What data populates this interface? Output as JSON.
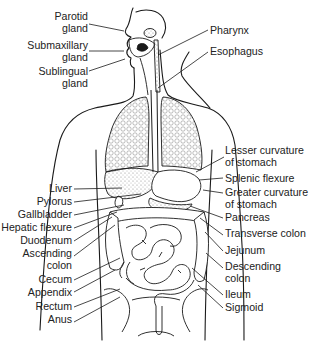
{
  "diagram": {
    "colors": {
      "ink": "#1a1a1a",
      "background": "#ffffff",
      "stipple": "#bdbdbd"
    },
    "left_labels": [
      {
        "id": "parotid-gland",
        "text": "Parotid\ngland",
        "x": 88,
        "y": 11,
        "line": [
          89,
          24,
          124,
          31
        ]
      },
      {
        "id": "submaxillary-gland",
        "text": "Submaxillary\ngland",
        "x": 88,
        "y": 40,
        "line": [
          89,
          51,
          124,
          51
        ]
      },
      {
        "id": "sublingual-gland",
        "text": "Sublingual\ngland",
        "x": 88,
        "y": 66,
        "line": [
          89,
          71,
          125,
          59
        ]
      },
      {
        "id": "liver",
        "text": "Liver",
        "x": 72,
        "y": 183,
        "line": [
          74,
          189,
          122,
          188
        ]
      },
      {
        "id": "pylorus",
        "text": "Pylorus",
        "x": 72,
        "y": 196,
        "line": [
          74,
          202,
          141,
          194
        ]
      },
      {
        "id": "gallbladder",
        "text": "Gallbladder",
        "x": 72,
        "y": 209,
        "line": [
          74,
          215,
          124,
          205
        ]
      },
      {
        "id": "hepatic-flexure",
        "text": "Hepatic flexure",
        "x": 72,
        "y": 222,
        "line": [
          74,
          228,
          117,
          212
        ]
      },
      {
        "id": "duodenum",
        "text": "Duodenum",
        "x": 72,
        "y": 235,
        "line": [
          74,
          241,
          112,
          217
        ]
      },
      {
        "id": "ascending-colon",
        "text": "Ascending\ncolon",
        "x": 72,
        "y": 248,
        "line": [
          74,
          256,
          115,
          225
        ]
      },
      {
        "id": "cecum",
        "text": "Cecum",
        "x": 72,
        "y": 274,
        "line": [
          74,
          280,
          120,
          258
        ]
      },
      {
        "id": "appendix",
        "text": "Appendix",
        "x": 72,
        "y": 287,
        "line": [
          74,
          292,
          115,
          270
        ]
      },
      {
        "id": "rectum",
        "text": "Rectum",
        "x": 72,
        "y": 301,
        "line": [
          74,
          307,
          120,
          289
        ]
      },
      {
        "id": "anus",
        "text": "Anus",
        "x": 72,
        "y": 314,
        "line": [
          74,
          322,
          120,
          297
        ]
      }
    ],
    "right_labels": [
      {
        "id": "pharynx",
        "text": "Pharynx",
        "x": 210,
        "y": 25,
        "line": [
          208,
          30,
          158,
          55
        ]
      },
      {
        "id": "esophagus",
        "text": "Esophagus",
        "x": 210,
        "y": 46,
        "line": [
          208,
          52,
          158,
          88
        ]
      },
      {
        "id": "lesser-curvature-of-stomach",
        "text": "Lesser curvature\nof stomach",
        "x": 225,
        "y": 145,
        "line": [
          224,
          157,
          196,
          172
        ]
      },
      {
        "id": "splenic-flexure",
        "text": "Splenic flexure",
        "x": 225,
        "y": 173,
        "line": [
          223,
          178,
          199,
          180
        ]
      },
      {
        "id": "greater-curvature-of-stomach",
        "text": "Greater curvature\nof stomach",
        "x": 225,
        "y": 187,
        "line": [
          223,
          193,
          203,
          190
        ]
      },
      {
        "id": "pancreas",
        "text": "Pancreas",
        "x": 225,
        "y": 212,
        "line": [
          223,
          218,
          190,
          206
        ]
      },
      {
        "id": "transverse-colon",
        "text": "Transverse colon",
        "x": 225,
        "y": 228,
        "line": [
          223,
          235,
          200,
          218
        ]
      },
      {
        "id": "jejunum",
        "text": "Jejunum",
        "x": 225,
        "y": 245,
        "line": [
          223,
          251,
          205,
          232
        ]
      },
      {
        "id": "descending-colon",
        "text": "Descending\ncolon",
        "x": 225,
        "y": 261,
        "line": [
          223,
          268,
          206,
          253
        ]
      },
      {
        "id": "ileum",
        "text": "Ileum",
        "x": 225,
        "y": 289,
        "line": [
          223,
          295,
          192,
          268
        ]
      },
      {
        "id": "sigmoid",
        "text": "Sigmoid",
        "x": 225,
        "y": 302,
        "line": [
          223,
          308,
          198,
          285
        ]
      }
    ]
  }
}
